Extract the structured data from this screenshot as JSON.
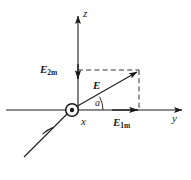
{
  "figure": {
    "background_color": "#ffffff",
    "line_color": "#1a1a1a",
    "axes": [
      {
        "name": "z",
        "label": "z",
        "orientation": "vertical-up"
      },
      {
        "name": "y",
        "label": "y",
        "orientation": "horizontal-right"
      },
      {
        "name": "x",
        "label": "x",
        "orientation": "out-of-page"
      }
    ],
    "vectors": [
      {
        "name": "E",
        "label": "E",
        "subscript": "",
        "description": "resultant field vector along diagonal"
      },
      {
        "name": "E1m",
        "label": "E",
        "subscript": "1m",
        "description": "horizontal component along y axis"
      },
      {
        "name": "E2m",
        "label": "E",
        "subscript": "2m",
        "description": "vertical component along z axis"
      }
    ],
    "angle": {
      "name": "alpha",
      "label": "a"
    },
    "origin_marker": "circle-with-dot",
    "dashed_guides": [
      "horizontal guide from z-axis to vector tip",
      "vertical guide from y-axis to vector tip"
    ]
  }
}
